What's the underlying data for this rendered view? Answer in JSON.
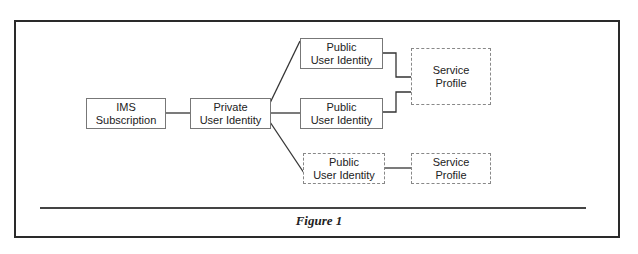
{
  "diagram": {
    "nodes": [
      {
        "id": "ims",
        "lines": [
          "IMS",
          "Subscription"
        ]
      },
      {
        "id": "private",
        "lines": [
          "Private",
          "User Identity"
        ]
      },
      {
        "id": "public1",
        "lines": [
          "Public",
          "User Identity"
        ]
      },
      {
        "id": "public2",
        "lines": [
          "Public",
          "User Identity"
        ]
      },
      {
        "id": "public3",
        "lines": [
          "Public",
          "User Identity"
        ]
      },
      {
        "id": "service1",
        "lines": [
          "Service",
          "Profile"
        ]
      },
      {
        "id": "service2",
        "lines": [
          "Service",
          "Profile"
        ]
      }
    ],
    "edges": [
      [
        "ims",
        "private"
      ],
      [
        "private",
        "public1"
      ],
      [
        "private",
        "public2"
      ],
      [
        "private",
        "public3"
      ],
      [
        "public1",
        "service1"
      ],
      [
        "public2",
        "service1"
      ],
      [
        "public3",
        "service2"
      ]
    ]
  },
  "caption": "Figure 1"
}
